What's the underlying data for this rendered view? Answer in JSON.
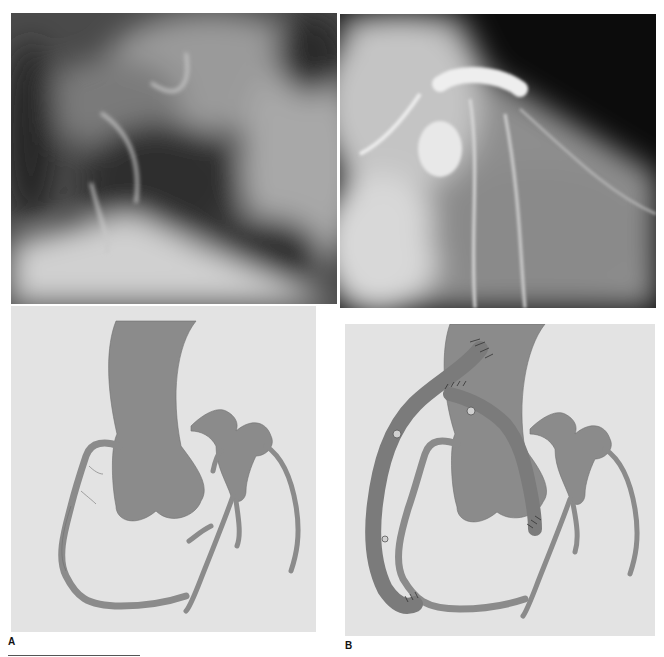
{
  "figure": {
    "panels": [
      {
        "id": "A",
        "label": "A",
        "angiogram": "coronary-angiogram-before",
        "schematic": "native-coronary-anatomy"
      },
      {
        "id": "B",
        "label": "B",
        "angiogram": "coronary-angiogram-left-coronary",
        "schematic": "coronary-bypass-grafts"
      }
    ],
    "colors": {
      "schematic_background": "#e3e3e3",
      "vessel": "#8b8b8b",
      "graft": "#7b7b7b",
      "vessel_outline": "#6e6e6e",
      "suture": "#333333"
    }
  }
}
